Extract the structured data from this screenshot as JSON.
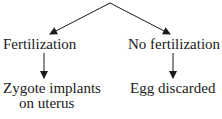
{
  "diagram": {
    "branches": [
      {
        "label": "Fertilization",
        "outcome_line1": "Zygote implants",
        "outcome_line2": "on uterus"
      },
      {
        "label": "No fertilization",
        "outcome_line1": "Egg discarded"
      }
    ],
    "colors": {
      "line": "#1a1a1a",
      "background": "#ffffff"
    }
  }
}
